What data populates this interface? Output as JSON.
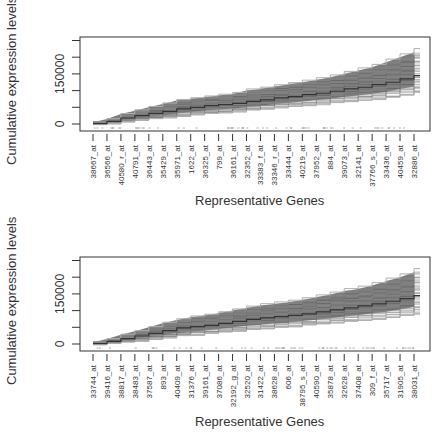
{
  "chart_data": [
    {
      "type": "line",
      "title": "",
      "xlabel": "Representative Genes",
      "ylabel": "Cumulative expression levels",
      "ytick_labels": [
        "0",
        "150000"
      ],
      "yticks": [
        0,
        50000,
        100000,
        150000,
        200000,
        250000
      ],
      "ylim": [
        0,
        250000
      ],
      "grid": false,
      "legend": "none",
      "categories": [
        "38667_at",
        "36566_at",
        "40580_r_at",
        "40791_at",
        "36443_at",
        "35429_at",
        "35971_at",
        "1622_at",
        "36325_at",
        "799_at",
        "36161_at",
        "32352_at",
        "33383_f_at",
        "33346_r_at",
        "33444_at",
        "40219_at",
        "37952_at",
        "884_at",
        "39073_at",
        "32141_at",
        "37766_s_at",
        "33436_at",
        "40459_at",
        "32886_at"
      ],
      "series": [
        {
          "name": "upper envelope",
          "values": [
            5000,
            15000,
            30000,
            40000,
            50000,
            60000,
            70000,
            75000,
            80000,
            85000,
            90000,
            100000,
            105000,
            112000,
            118000,
            125000,
            132000,
            140000,
            150000,
            160000,
            170000,
            185000,
            200000,
            215000
          ]
        },
        {
          "name": "median",
          "values": [
            2000,
            8000,
            18000,
            25000,
            32000,
            38000,
            45000,
            50000,
            55000,
            58000,
            62000,
            68000,
            72000,
            78000,
            82000,
            88000,
            92000,
            98000,
            105000,
            110000,
            118000,
            125000,
            135000,
            145000
          ]
        },
        {
          "name": "lower envelope",
          "values": [
            0,
            2000,
            8000,
            12000,
            16000,
            20000,
            24000,
            28000,
            32000,
            35000,
            38000,
            42000,
            45000,
            50000,
            53000,
            56000,
            60000,
            64000,
            68000,
            72000,
            76000,
            80000,
            88000,
            95000
          ]
        }
      ]
    },
    {
      "type": "line",
      "title": "",
      "xlabel": "Representative Genes",
      "ylabel": "Cumulative expression levels",
      "ytick_labels": [
        "0",
        "150000"
      ],
      "yticks": [
        0,
        50000,
        100000,
        150000,
        200000,
        250000
      ],
      "ylim": [
        0,
        250000
      ],
      "grid": false,
      "legend": "none",
      "categories": [
        "33744_at",
        "39416_at",
        "38817_at",
        "38483_at",
        "37587_at",
        "893_at",
        "40409_at",
        "31376_at",
        "39161_at",
        "37086_at",
        "32192_g_at",
        "32520_at",
        "31422_at",
        "38628_at",
        "606_at",
        "38795_s_at",
        "40590_at",
        "35878_at",
        "32628_at",
        "37408_at",
        "309_f_at",
        "35717_at",
        "31905_at",
        "38031_at"
      ],
      "series": [
        {
          "name": "upper envelope",
          "values": [
            5000,
            15000,
            28000,
            38000,
            50000,
            62000,
            72000,
            80000,
            85000,
            92000,
            100000,
            108000,
            115000,
            120000,
            125000,
            132000,
            140000,
            148000,
            158000,
            165000,
            175000,
            188000,
            200000,
            215000
          ]
        },
        {
          "name": "median",
          "values": [
            2000,
            8000,
            16000,
            24000,
            32000,
            40000,
            48000,
            52000,
            56000,
            62000,
            68000,
            74000,
            78000,
            82000,
            86000,
            90000,
            96000,
            102000,
            108000,
            114000,
            120000,
            128000,
            136000,
            145000
          ]
        },
        {
          "name": "lower envelope",
          "values": [
            0,
            2000,
            6000,
            10000,
            15000,
            20000,
            25000,
            28000,
            32000,
            36000,
            40000,
            44000,
            47000,
            50000,
            53000,
            57000,
            60000,
            64000,
            68000,
            72000,
            76000,
            80000,
            86000,
            92000
          ]
        }
      ]
    }
  ],
  "panels": [
    {
      "ylabel": "Cumulative expression levels",
      "xlabel": "Representative Genes",
      "ytick_0": "0",
      "ytick_150000": "150000"
    },
    {
      "ylabel": "Cumulative expression levels",
      "xlabel": "Representative Genes",
      "ytick_0": "0",
      "ytick_150000": "150000"
    }
  ],
  "colors": {
    "band": "#6e6e6e",
    "line_light": "#b0b0b0",
    "median": "#333333",
    "axis": "#333333"
  }
}
